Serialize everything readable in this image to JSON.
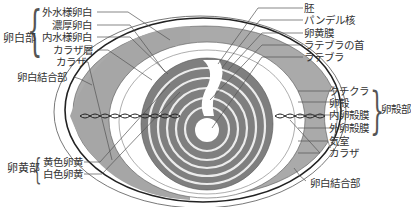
{
  "diagram": {
    "type": "egg cross-section",
    "colors": {
      "grey_fill": "#a9a9a9",
      "yolk_fill": "#7d7d7d",
      "line": "#222222",
      "leader": "#555555",
      "background": "#ffffff"
    }
  },
  "left_labels": {
    "albumen_group": {
      "title": "卵白部",
      "items": [
        "外水様卵白",
        "濃厚卵白",
        "内水様卵白",
        "カラザ層"
      ]
    },
    "chalaza": "カラザ",
    "albumen_junction": "卵白結合部",
    "yolk_group": {
      "title": "卵黄部",
      "items": [
        "黄色卵黄",
        "白色卵黄"
      ]
    }
  },
  "right_labels": {
    "top_items": [
      "胚",
      "パンデル核",
      "卵黄膜",
      "ラテブラの首",
      "ラテブラ"
    ],
    "shell_group": {
      "title": "卵殻部",
      "items": [
        "クチクラ",
        "卵殻",
        "内卵殻膜",
        "外卵殻膜"
      ]
    },
    "air_cell": "気室",
    "chalaza": "カラザ",
    "albumen_junction": "卵白結合部"
  }
}
